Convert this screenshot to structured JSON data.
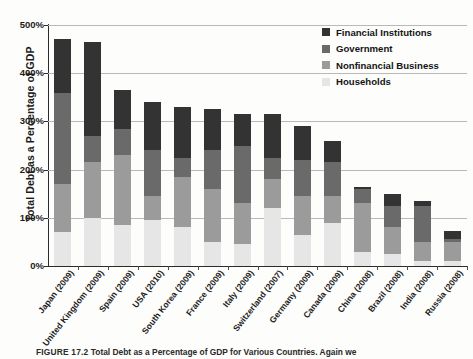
{
  "chart_data": {
    "type": "bar",
    "subtype": "stacked-vertical",
    "title": "",
    "xlabel": "",
    "ylabel": "Total Debt as a Percentage of GDP",
    "ylim": [
      0,
      500
    ],
    "ytick_labels": [
      "0%",
      "100%",
      "200%",
      "300%",
      "400%",
      "500%"
    ],
    "ytick_values": [
      0,
      100,
      200,
      300,
      400,
      500
    ],
    "grid": "horizontal",
    "legend_position": "top-right",
    "stack_order_bottom_to_top": [
      "Households",
      "Nonfinancial Business",
      "Government",
      "Financial Institutions"
    ],
    "categories": [
      "Japan (2009)",
      "United Kingdom (2009)",
      "Spain (2009)",
      "USA (2010)",
      "South Korea (2009)",
      "France (2009)",
      "Italy (2009)",
      "Switzerland (2007)",
      "Germany (2009)",
      "Canada (2009)",
      "China (2008)",
      "Brazil (2008)",
      "India (2008)",
      "Russia (2008)"
    ],
    "series": [
      {
        "name": "Households",
        "color": "#e6e6e6",
        "values": [
          70,
          100,
          85,
          95,
          80,
          50,
          45,
          120,
          65,
          90,
          30,
          25,
          10,
          10
        ]
      },
      {
        "name": "Nonfinancial Business",
        "color": "#9b9b9b",
        "values": [
          100,
          115,
          145,
          50,
          105,
          110,
          85,
          60,
          80,
          55,
          100,
          55,
          40,
          40
        ]
      },
      {
        "name": "Government",
        "color": "#6a6a6a",
        "values": [
          190,
          55,
          55,
          95,
          40,
          80,
          120,
          45,
          75,
          70,
          30,
          45,
          75,
          7
        ]
      },
      {
        "name": "Financial Institutions",
        "color": "#333333",
        "values": [
          110,
          195,
          80,
          100,
          105,
          85,
          65,
          90,
          70,
          45,
          5,
          25,
          10,
          15
        ]
      }
    ],
    "totals": [
      470,
      465,
      365,
      340,
      330,
      325,
      315,
      315,
      290,
      260,
      165,
      150,
      135,
      72
    ]
  },
  "legend": {
    "items": [
      {
        "label": "Financial Institutions",
        "color": "#333333"
      },
      {
        "label": "Government",
        "color": "#6a6a6a"
      },
      {
        "label": "Nonfinancial Business",
        "color": "#9b9b9b"
      },
      {
        "label": "Households",
        "color": "#e6e6e6"
      }
    ]
  },
  "caption": {
    "number": "FIGURE 17.2",
    "text": "Total Debt as a Percentage of GDP for Various Countries. Again we"
  }
}
